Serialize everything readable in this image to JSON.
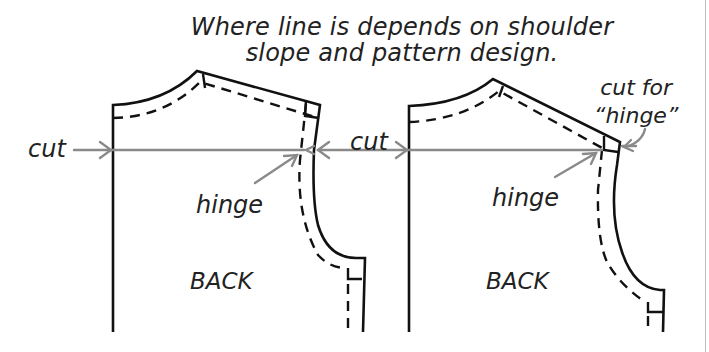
{
  "title": {
    "line1": "Where line is depends on shoulder",
    "line2": "slope and pattern design."
  },
  "labels": {
    "cut_left": "cut",
    "cut_middle": "cut",
    "hinge_left": "hinge",
    "hinge_right": "hinge",
    "back_left": "BACK",
    "back_right": "BACK",
    "cut_for_line1": "cut for",
    "cut_for_line2": "“hinge”"
  },
  "colors": {
    "outline": "#111111",
    "guide": "#8a8a8a",
    "text": "#222222"
  }
}
